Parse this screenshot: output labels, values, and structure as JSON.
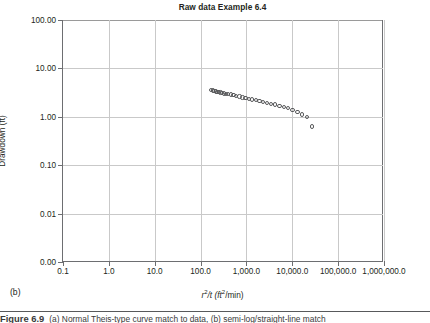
{
  "figure": {
    "panel_label": "(b)",
    "title": "Raw data Example 6.4"
  },
  "caption": {
    "number": "Figure 6.9",
    "text": "(a) Normal Theis-type curve match to data, (b) semi-log/straight-line match"
  },
  "axis_titles": {
    "y": "Drawdown (ft)",
    "x_prefix": "r",
    "x_sup1": "2",
    "x_mid": "/t (ft",
    "x_sup2": "2",
    "x_suffix": "/min)"
  },
  "chart_data": {
    "type": "scatter",
    "title": "Raw data Example 6.4",
    "xlabel": "r2/t (ft2/min)",
    "ylabel": "Drawdown (ft)",
    "xscale": "log",
    "yscale": "log-ordinal",
    "xlim": [
      0.1,
      1000000.0
    ],
    "ylim": [
      0.0,
      100.0
    ],
    "grid": true,
    "legend": "none",
    "marker": "open-circle",
    "marker_color": "#58595b",
    "xtick_labels": [
      "0.1",
      "1.0",
      "10.0",
      "100.0",
      "1,000.0",
      "10,000.0",
      "100,000.0",
      "1,000,000.0"
    ],
    "xtick_values": [
      0.1,
      1.0,
      10.0,
      100.0,
      1000.0,
      10000.0,
      100000.0,
      1000000.0
    ],
    "ytick_labels": [
      "100.00",
      "10.00",
      "1.00",
      "0.10",
      "0.01",
      "0.00"
    ],
    "ytick_values": [
      100.0,
      10.0,
      1.0,
      0.1,
      0.01,
      0.0
    ],
    "x": [
      170,
      185,
      200,
      215,
      232,
      250,
      270,
      292,
      320,
      355,
      400,
      455,
      520,
      600,
      700,
      820,
      960,
      1130,
      1340,
      1600,
      1920,
      2320,
      2820,
      3450,
      4250,
      5250,
      6500,
      8100,
      10200,
      12900,
      16400,
      21000,
      27000
    ],
    "y": [
      3.55,
      3.5,
      3.42,
      3.35,
      3.3,
      3.25,
      3.2,
      3.12,
      3.05,
      3.0,
      2.95,
      2.9,
      2.82,
      2.72,
      2.62,
      2.52,
      2.44,
      2.36,
      2.28,
      2.2,
      2.1,
      2.0,
      1.92,
      1.85,
      1.78,
      1.68,
      1.58,
      1.5,
      1.38,
      1.25,
      1.12,
      0.98,
      0.63
    ]
  }
}
